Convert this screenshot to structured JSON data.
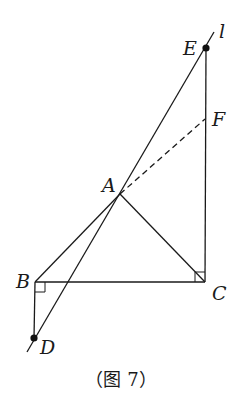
{
  "figure": {
    "caption": "（图 7）",
    "points": {
      "E": {
        "label": "E",
        "x": 206,
        "y": 48,
        "dot": true
      },
      "F": {
        "label": "F",
        "x": 205,
        "y": 119,
        "dot": false
      },
      "A": {
        "label": "A",
        "x": 120,
        "y": 194,
        "dot": false
      },
      "B": {
        "label": "B",
        "x": 35,
        "y": 282,
        "dot": false
      },
      "C": {
        "label": "C",
        "x": 205,
        "y": 282,
        "dot": false
      },
      "D": {
        "label": "D",
        "x": 34,
        "y": 338,
        "dot": true
      }
    },
    "line_label": "l",
    "segments": [
      {
        "from": "A",
        "to": "B",
        "style": "solid"
      },
      {
        "from": "A",
        "to": "C",
        "style": "solid"
      },
      {
        "from": "B",
        "to": "C",
        "style": "solid"
      },
      {
        "from": "B",
        "to": "D",
        "style": "solid"
      },
      {
        "from": "C",
        "to": "E",
        "style": "solid"
      },
      {
        "from": "A",
        "to": "F",
        "style": "dashed"
      },
      {
        "from": "D",
        "to": "E",
        "style": "solid",
        "extended": true,
        "name": "l"
      }
    ],
    "right_angles": [
      "B",
      "C"
    ]
  }
}
